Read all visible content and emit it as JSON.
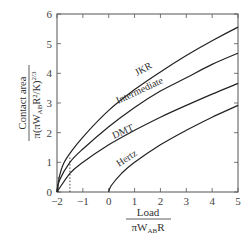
{
  "chart_data": {
    "type": "line",
    "title": "",
    "xlabel": "Load / (π W_AB R)",
    "ylabel": "Contact area / π(π W_AB R²/K)^(2/3)",
    "xlim": [
      -2,
      5
    ],
    "ylim": [
      0,
      6
    ],
    "x_ticks": [
      "-2",
      "-1",
      "0",
      "1",
      "2",
      "3",
      "4",
      "5"
    ],
    "y_ticks": [
      "0",
      "1",
      "2",
      "3",
      "4",
      "5",
      "6"
    ],
    "grid": false,
    "legend": "inline labels on curves",
    "series": [
      {
        "name": "JKR",
        "x": [
          -2,
          -1.9,
          -1.75,
          -1.5,
          -1,
          0,
          1,
          2,
          3,
          4,
          5
        ],
        "y": [
          0,
          0.55,
          0.95,
          1.3,
          1.85,
          2.75,
          3.45,
          4.05,
          4.6,
          5.1,
          5.56
        ]
      },
      {
        "name": "Intermediate",
        "x": [
          -2,
          -1.9,
          -1.5,
          -1,
          0,
          1,
          2,
          3,
          4,
          5
        ],
        "y": [
          0,
          0.4,
          1.0,
          1.45,
          2.2,
          2.85,
          3.4,
          3.85,
          4.3,
          4.68
        ]
      },
      {
        "name": "DMT",
        "x": [
          -2,
          -1.5,
          -1,
          0,
          1,
          2,
          3,
          4,
          5
        ],
        "y": [
          0,
          0.63,
          1.0,
          1.59,
          2.08,
          2.52,
          2.92,
          3.3,
          3.66
        ]
      },
      {
        "name": "Hertz",
        "x": [
          0,
          0.1,
          0.5,
          1,
          2,
          3,
          4,
          5
        ],
        "y": [
          0,
          0.22,
          0.63,
          1.0,
          1.59,
          2.08,
          2.52,
          2.92
        ]
      }
    ],
    "annotations": [
      {
        "type": "dotted-vertical",
        "x": -1.5,
        "y_from": 0,
        "y_to": 1.2
      },
      {
        "type": "dotted-vertical",
        "x": -1.95,
        "y_from": 0,
        "y_to": 0.55
      }
    ]
  },
  "labels": {
    "jkr": "JKR",
    "intermediate": "Intermediate",
    "dmt": "DMT",
    "hertz": "Hertz",
    "y_num": "Contact area",
    "y_den": "π(πW",
    "y_den_sub": "AB",
    "y_den_rest": "R²/K)",
    "y_den_sup": "2/3",
    "x_num": "Load",
    "x_den": "πW",
    "x_den_sub": "AB",
    "x_den_rest": "R"
  }
}
